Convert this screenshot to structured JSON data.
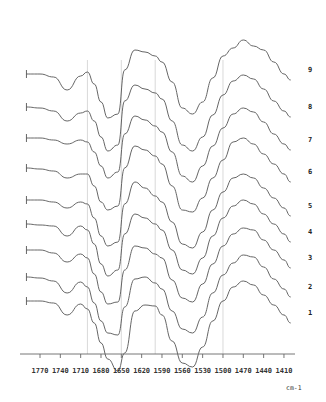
{
  "chart_data": {
    "type": "line",
    "title": "",
    "xlabel": "cm-1",
    "ylabel": "",
    "x_reversed": true,
    "xlim": [
      1790,
      1395
    ],
    "x_ticks": [
      1770,
      1740,
      1710,
      1680,
      1650,
      1620,
      1590,
      1560,
      1530,
      1500,
      1470,
      1440,
      1410
    ],
    "x_tick_labels": [
      "1770",
      "1740",
      "1710",
      "1680",
      "1650",
      "1620",
      "1590",
      "1560",
      "1530",
      "1500",
      "1470",
      "1440",
      "1410"
    ],
    "reference_lines_x": [
      1700,
      1650,
      1600,
      1500
    ],
    "grid": false,
    "legend": "curve numbers at right end",
    "stacked_offset": true,
    "x": [
      1790,
      1770,
      1750,
      1730,
      1710,
      1700,
      1690,
      1680,
      1670,
      1655,
      1645,
      1630,
      1615,
      1600,
      1590,
      1575,
      1560,
      1545,
      1530,
      1515,
      1500,
      1485,
      1470,
      1455,
      1440,
      1425,
      1410,
      1400
    ],
    "series": [
      {
        "name": "1",
        "baseline_y": 301,
        "values": [
          0,
          0,
          2,
          14,
          3,
          8,
          22,
          42,
          58,
          70,
          52,
          10,
          4,
          5,
          14,
          40,
          62,
          66,
          46,
          20,
          0,
          -14,
          -20,
          -16,
          -6,
          4,
          14,
          22
        ]
      },
      {
        "name": "2",
        "baseline_y": 277,
        "values": [
          0,
          1,
          4,
          16,
          5,
          10,
          26,
          44,
          56,
          58,
          30,
          2,
          0,
          6,
          12,
          34,
          52,
          56,
          40,
          16,
          -2,
          -14,
          -22,
          -20,
          -10,
          2,
          12,
          20
        ]
      },
      {
        "name": "3",
        "baseline_y": 250,
        "values": [
          0,
          0,
          3,
          12,
          4,
          8,
          24,
          42,
          54,
          52,
          20,
          -4,
          -2,
          4,
          8,
          30,
          48,
          52,
          34,
          14,
          -4,
          -16,
          -22,
          -20,
          -10,
          0,
          10,
          18
        ]
      },
      {
        "name": "4",
        "baseline_y": 224,
        "values": [
          0,
          1,
          2,
          12,
          2,
          6,
          20,
          40,
          52,
          46,
          10,
          -10,
          -6,
          0,
          6,
          26,
          46,
          50,
          34,
          12,
          -6,
          -18,
          -24,
          -20,
          -10,
          0,
          10,
          18
        ]
      },
      {
        "name": "5",
        "baseline_y": 200,
        "values": [
          0,
          0,
          2,
          8,
          2,
          4,
          18,
          36,
          46,
          42,
          4,
          -18,
          -12,
          -4,
          2,
          22,
          44,
          48,
          32,
          10,
          -8,
          -22,
          -26,
          -22,
          -12,
          -2,
          8,
          16
        ]
      },
      {
        "name": "6",
        "baseline_y": 168,
        "values": [
          0,
          1,
          3,
          10,
          6,
          6,
          18,
          34,
          42,
          38,
          0,
          -22,
          -18,
          -12,
          -4,
          18,
          42,
          44,
          30,
          10,
          -8,
          -26,
          -30,
          -24,
          -14,
          -4,
          6,
          14
        ]
      },
      {
        "name": "7",
        "baseline_y": 138,
        "values": [
          0,
          0,
          2,
          6,
          2,
          4,
          14,
          28,
          40,
          34,
          -4,
          -22,
          -18,
          -12,
          -6,
          14,
          38,
          44,
          28,
          8,
          -10,
          -24,
          -30,
          -26,
          -16,
          -4,
          6,
          12
        ]
      },
      {
        "name": "8",
        "baseline_y": 107,
        "values": [
          0,
          1,
          4,
          14,
          6,
          4,
          14,
          30,
          44,
          38,
          -6,
          -22,
          -18,
          -14,
          -8,
          14,
          38,
          44,
          30,
          8,
          -12,
          -26,
          -32,
          -28,
          -18,
          -6,
          4,
          10
        ]
      },
      {
        "name": "9",
        "baseline_y": 74,
        "values": [
          0,
          0,
          3,
          16,
          2,
          -2,
          10,
          28,
          44,
          40,
          -4,
          -24,
          -22,
          -18,
          -12,
          8,
          34,
          40,
          28,
          4,
          -18,
          -26,
          -34,
          -28,
          -24,
          -12,
          0,
          6
        ]
      }
    ]
  }
}
